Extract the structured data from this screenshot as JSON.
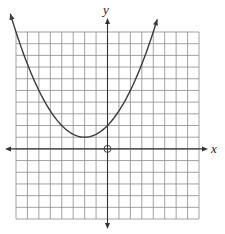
{
  "chart_data": {
    "type": "line",
    "title": "",
    "xlabel": "x",
    "ylabel": "y",
    "xlim": [
      -8,
      8
    ],
    "ylim": [
      -6,
      10
    ],
    "grid": true,
    "grid_step": 1,
    "origin_marker": "open-circle",
    "series": [
      {
        "name": "parabola",
        "equation": "y = 0.25(x + 2)^2 + 1",
        "vertex": [
          -2,
          1
        ],
        "y_intercept": [
          0,
          2
        ],
        "x": [
          -8,
          -7,
          -6,
          -5,
          -4,
          -3,
          -2,
          -1,
          0,
          1,
          2,
          3,
          4
        ],
        "values": [
          10,
          7.25,
          5,
          3.25,
          2,
          1.25,
          1,
          1.25,
          2,
          3.25,
          5,
          7.25,
          10
        ],
        "arrows_at_ends": true
      }
    ]
  },
  "labels": {
    "x_axis": "x",
    "y_axis": "y"
  },
  "colors": {
    "grid": "#8a8a8a",
    "axis": "#333333",
    "curve": "#3a3a3a",
    "background": "#ffffff"
  }
}
